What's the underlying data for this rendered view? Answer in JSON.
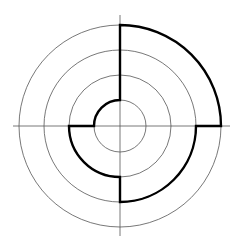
{
  "diagram": {
    "type": "concentric-circle-maze",
    "center": [
      120,
      126
    ],
    "rings": [
      26,
      51,
      76,
      101
    ],
    "axes": {
      "horizontal": [
        13,
        230
      ],
      "vertical": [
        15,
        236
      ]
    },
    "colors": {
      "thin": "#555555",
      "thick": "#000000",
      "background": "#ffffff"
    },
    "path_segments": [
      "radial top: outer ring to inner ring",
      "arc ring1: top to left (counterclockwise)",
      "radial left: ring1 to ring2",
      "arc ring2: left to bottom",
      "radial bottom: ring2 to ring3",
      "arc ring3: bottom to right",
      "radial right: ring3 to ring4",
      "arc ring4: right to top"
    ]
  }
}
